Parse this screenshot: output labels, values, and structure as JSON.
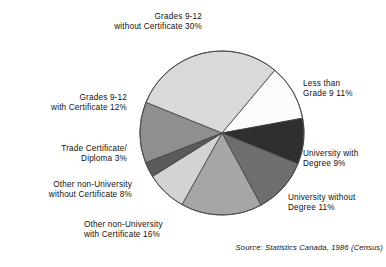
{
  "chart_data": {
    "type": "pie",
    "title": "",
    "source": "Source: Statistics Canada, 1986 (Census)",
    "unit": "%",
    "legend_position": "outside-callout-labels",
    "grid": false,
    "start_angle_deg": -50,
    "direction": "clockwise",
    "categories": [
      "Less than Grade 9",
      "University with Degree",
      "University without Degree",
      "Other non-University with Certificate",
      "Other non-University without Certificate",
      "Trade Certificate/ Diploma",
      "Grades 9-12 with Certificate",
      "Grades 9-12 without Certificate"
    ],
    "values": [
      11,
      9,
      11,
      16,
      8,
      3,
      12,
      30
    ],
    "colors": [
      "#fbfbfb",
      "#2f2f2f",
      "#6e6e6e",
      "#a6a6a6",
      "#d3d3d3",
      "#5a5a5a",
      "#8f8f8f",
      "#d9d9d9"
    ],
    "slices": [
      {
        "label": "Less than Grade 9",
        "value": 11,
        "color": "#fbfbfb"
      },
      {
        "label": "University with Degree",
        "value": 9,
        "color": "#2f2f2f"
      },
      {
        "label": "University without Degree",
        "value": 11,
        "color": "#6e6e6e"
      },
      {
        "label": "Other non-University with Certificate",
        "value": 16,
        "color": "#a6a6a6"
      },
      {
        "label": "Other non-University without Certificate",
        "value": 8,
        "color": "#d3d3d3"
      },
      {
        "label": "Trade Certificate/ Diploma",
        "value": 3,
        "color": "#5a5a5a"
      },
      {
        "label": "Grades 9-12 with Certificate",
        "value": 12,
        "color": "#8f8f8f"
      },
      {
        "label": "Grades 9-12 without Certificate",
        "value": 30,
        "color": "#d9d9d9"
      }
    ]
  },
  "labels": {
    "grades_without_certificate": {
      "line1": "Grades 9-12",
      "line2": "without Certificate 30%"
    },
    "less_than_grade9": {
      "line1": "Less than",
      "line2": "Grade 9  11%"
    },
    "university_with_degree": {
      "line1": "University with",
      "line2": "Degree  9%"
    },
    "university_without_degree": {
      "line1": "University without",
      "line2": "Degree  11%"
    },
    "grades_with_certificate": {
      "line1": "Grades 9-12",
      "line2": "with Certificate 12%"
    },
    "trade_certificate": {
      "line1": "Trade Certificate/",
      "line2": "Diploma 3%"
    },
    "other_non_university_without": {
      "line1": "Other non-University",
      "line2": "without Certificate 8%"
    },
    "other_non_university_with": {
      "line1": "Other non-University",
      "line2": "with Certificate 16%"
    }
  },
  "footer": {
    "source": "Source: Statistics Canada, 1986 (Census)"
  }
}
